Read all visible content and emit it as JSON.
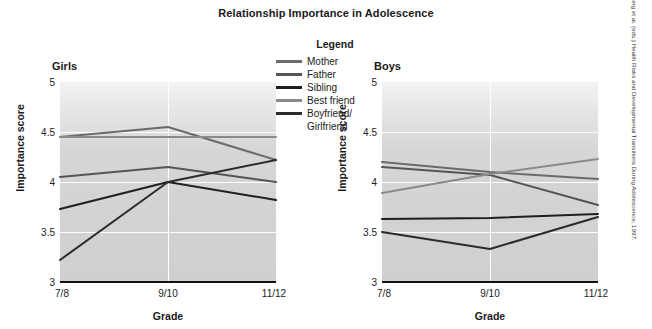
{
  "title": "Relationship Importance in Adolescence",
  "legend": {
    "heading": "Legend",
    "items": [
      {
        "label": "Mother",
        "color": "#6b6b6b"
      },
      {
        "label": "Father",
        "color": "#555555"
      },
      {
        "label": "Sibling",
        "color": "#1f1f1f"
      },
      {
        "label": "Best friend",
        "color": "#8a8a8a"
      },
      {
        "label": "Boyfriend/\nGirlfriend",
        "color": "#2b2b2b"
      }
    ]
  },
  "source": "SOURCE: From Brown, Dolcini, & Leventhal, \"Transformations in peer relationships at adolescence,\" p. 169 in Schulenberg et al. (eds.) Health Risks and Developmental Transitions During Adolescence, 1997.",
  "panels": [
    {
      "key": "girls",
      "title": "Girls",
      "xlabel": "Grade",
      "ylabel": "Importance score"
    },
    {
      "key": "boys",
      "title": "Boys",
      "xlabel": "Grade",
      "ylabel": "Importance score"
    }
  ],
  "axis": {
    "yticks": [
      "5",
      "4.5",
      "4",
      "3.5",
      "3"
    ],
    "xticks": [
      "7/8",
      "9/10",
      "11/12"
    ]
  },
  "chart_data": [
    {
      "type": "line",
      "title": "Girls",
      "xlabel": "Grade",
      "ylabel": "Importance score",
      "categories": [
        "7/8",
        "9/10",
        "11/12"
      ],
      "ylim": [
        3,
        5
      ],
      "yticks": [
        3,
        3.5,
        4,
        4.5,
        5
      ],
      "grid": true,
      "legend_position": "top-center",
      "series": [
        {
          "name": "Mother",
          "color": "#6b6b6b",
          "values": [
            4.45,
            4.55,
            4.22
          ]
        },
        {
          "name": "Father",
          "color": "#555555",
          "values": [
            4.05,
            4.15,
            4.0
          ]
        },
        {
          "name": "Sibling",
          "color": "#1f1f1f",
          "values": [
            3.73,
            4.0,
            3.82
          ]
        },
        {
          "name": "Best friend",
          "color": "#8a8a8a",
          "values": [
            4.45,
            4.45,
            4.45
          ]
        },
        {
          "name": "Boyfriend/Girlfriend",
          "color": "#2b2b2b",
          "values": [
            3.22,
            4.0,
            4.22
          ]
        }
      ]
    },
    {
      "type": "line",
      "title": "Boys",
      "xlabel": "Grade",
      "ylabel": "Importance score",
      "categories": [
        "7/8",
        "9/10",
        "11/12"
      ],
      "ylim": [
        3,
        5
      ],
      "yticks": [
        3,
        3.5,
        4,
        4.5,
        5
      ],
      "grid": true,
      "legend_position": "top-center",
      "series": [
        {
          "name": "Mother",
          "color": "#6b6b6b",
          "values": [
            4.2,
            4.1,
            4.03
          ]
        },
        {
          "name": "Father",
          "color": "#555555",
          "values": [
            4.15,
            4.07,
            3.77
          ]
        },
        {
          "name": "Sibling",
          "color": "#1f1f1f",
          "values": [
            3.63,
            3.64,
            3.68
          ]
        },
        {
          "name": "Best friend",
          "color": "#8a8a8a",
          "values": [
            3.89,
            4.08,
            4.23
          ]
        },
        {
          "name": "Boyfriend/Girlfriend",
          "color": "#2b2b2b",
          "values": [
            3.5,
            3.33,
            3.65
          ]
        }
      ]
    }
  ]
}
